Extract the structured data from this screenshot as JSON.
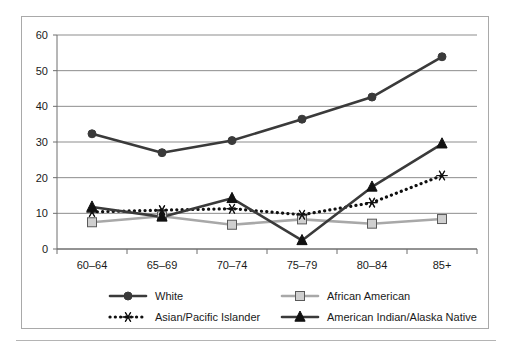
{
  "chart_data": {
    "type": "line",
    "title": "",
    "subtitle": "",
    "xlabel": "",
    "ylabel": "",
    "categories": [
      "60–64",
      "65–69",
      "70–74",
      "75–79",
      "80–84",
      "85+"
    ],
    "ylim": [
      0,
      60
    ],
    "yticks": [
      0,
      10,
      20,
      30,
      40,
      50,
      60
    ],
    "ytick_labels": [
      "0",
      "10",
      "20",
      "30",
      "40",
      "50",
      "60"
    ],
    "grid": "horizontal",
    "legend_position": "bottom",
    "series": [
      {
        "name": "White",
        "marker": "diamond",
        "line_style": "solid",
        "color": "#3a3a3a",
        "values": [
          32.3,
          27.0,
          30.4,
          36.4,
          42.6,
          53.9
        ]
      },
      {
        "name": "African American",
        "marker": "square",
        "line_style": "solid",
        "color": "#a8a8a8",
        "values": [
          7.5,
          9.2,
          6.8,
          8.3,
          7.1,
          8.4
        ]
      },
      {
        "name": "Asian/Pacific Islander",
        "marker": "asterisk",
        "line_style": "dotted",
        "color": "#101010",
        "values": [
          10.4,
          10.9,
          11.3,
          9.6,
          13.0,
          20.6
        ]
      },
      {
        "name": "American Indian/Alaska Native",
        "marker": "triangle",
        "line_style": "solid",
        "color": "#3a3a3a",
        "values": [
          11.8,
          9.0,
          14.2,
          2.4,
          17.4,
          29.5
        ]
      }
    ]
  },
  "legend": {
    "entries": [
      {
        "label": "White",
        "marker": "diamond",
        "line_style": "solid",
        "color": "#3a3a3a"
      },
      {
        "label": "African American",
        "marker": "square",
        "line_style": "solid",
        "color": "#a8a8a8"
      },
      {
        "label": "Asian/Pacific Islander",
        "marker": "asterisk",
        "line_style": "dotted",
        "color": "#101010"
      },
      {
        "label": "American Indian/Alaska Native",
        "marker": "triangle",
        "line_style": "solid",
        "color": "#3a3a3a"
      }
    ]
  },
  "colors": {
    "frame": "#a9a9a9",
    "gridline": "#8d8d8d",
    "axis": "#6e6e6e",
    "text": "#1a1a1a",
    "background": "#ffffff"
  }
}
